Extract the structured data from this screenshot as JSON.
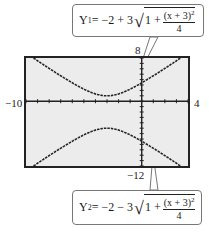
{
  "chart_data": {
    "type": "line",
    "title": "",
    "xlabel": "",
    "ylabel": "",
    "xlim": [
      -10,
      4
    ],
    "ylim": [
      -12,
      8
    ],
    "grid": false,
    "tick_labels": {
      "xmin": "−10",
      "xmax": "4",
      "ymin": "−12",
      "ymax": "8"
    },
    "series": [
      {
        "name": "Y1",
        "equation_parts": {
          "lhs": "Y",
          "sub": "1",
          "rhs_prefix": "= −2 + 3",
          "rad": "1 + ",
          "num": "(x + 3)",
          "pow": "2",
          "den": "4"
        },
        "x": [
          -10,
          -8,
          -6,
          -4,
          -3,
          -2,
          0,
          2,
          4
        ],
        "y": [
          8.94,
          7.01,
          3.41,
          -0.35,
          1.0,
          -0.35,
          3.41,
          7.01,
          8.94
        ]
      },
      {
        "name": "Y2",
        "equation_parts": {
          "lhs": "Y",
          "sub": "2",
          "rhs_prefix": "= −2 − 3",
          "rad": "1 + ",
          "num": "(x + 3)",
          "pow": "2",
          "den": "4"
        },
        "x": [
          -10,
          -8,
          -6,
          -4,
          -3,
          -2,
          0,
          2,
          4
        ],
        "y": [
          -12.94,
          -11.01,
          -7.41,
          -5.35,
          -5.0,
          -5.35,
          -7.41,
          -11.01,
          -12.94
        ]
      }
    ]
  },
  "labels": {
    "xmin": "−10",
    "xmax": "4",
    "ymin": "−12",
    "ymax": "8"
  },
  "callouts": {
    "top": {
      "lhs": "Y",
      "sub": "1",
      "rhs": " = −2 + 3",
      "rad": "1 + ",
      "num": "(x + 3)",
      "pow": "2",
      "den": "4"
    },
    "bottom": {
      "lhs": "Y",
      "sub": "2",
      "rhs": " = −2 − 3",
      "rad": "1 + ",
      "num": "(x + 3)",
      "pow": "2",
      "den": "4"
    }
  }
}
